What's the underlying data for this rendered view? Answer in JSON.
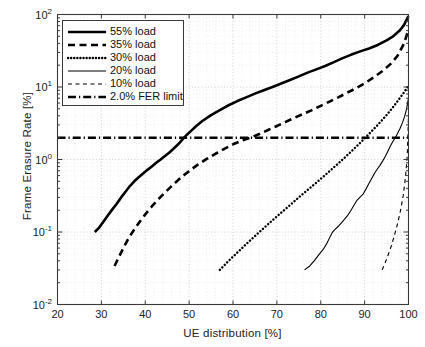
{
  "chart_data": {
    "type": "line",
    "title": "",
    "xlabel": "UE distribution [%]",
    "ylabel": "Frame Erasure Rate [%]",
    "xlim": [
      20,
      100
    ],
    "ylim": [
      0.01,
      100
    ],
    "yscale": "log",
    "xscale": "linear",
    "xticks": [
      "20",
      "30",
      "40",
      "50",
      "60",
      "70",
      "80",
      "90",
      "100"
    ],
    "xtick_values": [
      20,
      30,
      40,
      50,
      60,
      70,
      80,
      90,
      100
    ],
    "ytick_labels": [
      "10",
      "10",
      "10",
      "10",
      "10"
    ],
    "ytick_exponents": [
      "2",
      "1",
      "0",
      "-1",
      "-2"
    ],
    "ytick_values": [
      100,
      10,
      1,
      0.1,
      0.01
    ],
    "grid": true,
    "grid_minor": true,
    "legend_position": "upper left",
    "series": [
      {
        "name": "55% load",
        "style": "solid",
        "width": 2.6,
        "color": "#000000",
        "points": [
          [
            28.5,
            0.1
          ],
          [
            29.5,
            0.115
          ],
          [
            30.5,
            0.14
          ],
          [
            31.5,
            0.17
          ],
          [
            32.5,
            0.205
          ],
          [
            33.5,
            0.245
          ],
          [
            34.5,
            0.3
          ],
          [
            35.5,
            0.36
          ],
          [
            36.5,
            0.43
          ],
          [
            37.5,
            0.5
          ],
          [
            38.5,
            0.57
          ],
          [
            39.5,
            0.64
          ],
          [
            40.5,
            0.72
          ],
          [
            41.5,
            0.8
          ],
          [
            42.5,
            0.9
          ],
          [
            43.5,
            1.0
          ],
          [
            44.5,
            1.12
          ],
          [
            45.5,
            1.25
          ],
          [
            46.5,
            1.42
          ],
          [
            47.5,
            1.62
          ],
          [
            48.5,
            1.9
          ],
          [
            49.5,
            2.2
          ],
          [
            50.5,
            2.5
          ],
          [
            51.5,
            2.85
          ],
          [
            53.0,
            3.4
          ],
          [
            55.0,
            4.1
          ],
          [
            57.0,
            4.8
          ],
          [
            59.0,
            5.6
          ],
          [
            61.0,
            6.4
          ],
          [
            63.0,
            7.2
          ],
          [
            65.0,
            8.1
          ],
          [
            67.0,
            9.0
          ],
          [
            69.0,
            10.0
          ],
          [
            71.0,
            11.2
          ],
          [
            73.0,
            12.5
          ],
          [
            75.0,
            14.0
          ],
          [
            77.0,
            15.8
          ],
          [
            79.0,
            17.5
          ],
          [
            81.0,
            19.5
          ],
          [
            83.0,
            22.0
          ],
          [
            85.0,
            25.0
          ],
          [
            87.0,
            28.0
          ],
          [
            89.0,
            31.0
          ],
          [
            91.0,
            34.0
          ],
          [
            93.0,
            38.0
          ],
          [
            95.0,
            44.0
          ],
          [
            96.5,
            50.0
          ],
          [
            98.0,
            60.0
          ],
          [
            99.0,
            72.0
          ],
          [
            99.7,
            88.0
          ],
          [
            100.0,
            95.0
          ]
        ]
      },
      {
        "name": "35% load",
        "style": "dashed",
        "width": 2.6,
        "color": "#000000",
        "points": [
          [
            33.0,
            0.034
          ],
          [
            34.0,
            0.045
          ],
          [
            35.0,
            0.06
          ],
          [
            36.0,
            0.078
          ],
          [
            37.0,
            0.098
          ],
          [
            38.0,
            0.12
          ],
          [
            39.0,
            0.145
          ],
          [
            40.0,
            0.175
          ],
          [
            41.5,
            0.225
          ],
          [
            43.0,
            0.285
          ],
          [
            44.5,
            0.35
          ],
          [
            46.0,
            0.43
          ],
          [
            47.5,
            0.52
          ],
          [
            49.0,
            0.62
          ],
          [
            50.5,
            0.73
          ],
          [
            52.0,
            0.85
          ],
          [
            54.0,
            1.02
          ],
          [
            56.0,
            1.2
          ],
          [
            58.0,
            1.4
          ],
          [
            60.0,
            1.62
          ],
          [
            62.0,
            1.82
          ],
          [
            64.0,
            2.0
          ],
          [
            66.0,
            2.25
          ],
          [
            68.0,
            2.55
          ],
          [
            70.0,
            2.9
          ],
          [
            72.0,
            3.3
          ],
          [
            74.0,
            3.75
          ],
          [
            76.0,
            4.25
          ],
          [
            78.0,
            4.8
          ],
          [
            80.0,
            5.5
          ],
          [
            82.0,
            6.3
          ],
          [
            84.0,
            7.2
          ],
          [
            86.0,
            8.3
          ],
          [
            88.0,
            9.6
          ],
          [
            90.0,
            11.2
          ],
          [
            92.0,
            13.5
          ],
          [
            94.0,
            16.5
          ],
          [
            96.0,
            21.0
          ],
          [
            97.5,
            27.0
          ],
          [
            99.0,
            40.0
          ],
          [
            100.0,
            62.0
          ]
        ]
      },
      {
        "name": "30% load",
        "style": "dotted",
        "width": 2.4,
        "color": "#000000",
        "points": [
          [
            57.0,
            0.03
          ],
          [
            59.0,
            0.04
          ],
          [
            61.0,
            0.052
          ],
          [
            63.0,
            0.068
          ],
          [
            65.0,
            0.088
          ],
          [
            67.0,
            0.113
          ],
          [
            69.0,
            0.145
          ],
          [
            71.0,
            0.185
          ],
          [
            73.0,
            0.235
          ],
          [
            75.0,
            0.3
          ],
          [
            77.0,
            0.38
          ],
          [
            79.0,
            0.48
          ],
          [
            81.0,
            0.61
          ],
          [
            83.0,
            0.78
          ],
          [
            85.0,
            1.0
          ],
          [
            87.0,
            1.3
          ],
          [
            89.0,
            1.7
          ],
          [
            91.0,
            2.25
          ],
          [
            93.0,
            3.0
          ],
          [
            95.0,
            4.1
          ],
          [
            96.5,
            5.3
          ],
          [
            98.0,
            7.0
          ],
          [
            99.2,
            8.8
          ],
          [
            100.0,
            10.5
          ]
        ]
      },
      {
        "name": "20% load",
        "style": "solid",
        "width": 1.1,
        "color": "#000000",
        "points": [
          [
            76.3,
            0.03
          ],
          [
            77.5,
            0.034
          ],
          [
            78.5,
            0.04
          ],
          [
            79.5,
            0.048
          ],
          [
            80.5,
            0.057
          ],
          [
            81.3,
            0.068
          ],
          [
            82.0,
            0.083
          ],
          [
            82.6,
            0.098
          ],
          [
            83.2,
            0.108
          ],
          [
            84.0,
            0.12
          ],
          [
            85.0,
            0.14
          ],
          [
            86.0,
            0.165
          ],
          [
            86.8,
            0.195
          ],
          [
            87.5,
            0.23
          ],
          [
            88.2,
            0.27
          ],
          [
            88.9,
            0.3
          ],
          [
            89.6,
            0.33
          ],
          [
            90.3,
            0.39
          ],
          [
            91.0,
            0.47
          ],
          [
            91.7,
            0.56
          ],
          [
            92.3,
            0.65
          ],
          [
            92.9,
            0.74
          ],
          [
            93.5,
            0.83
          ],
          [
            94.1,
            0.95
          ],
          [
            94.7,
            1.1
          ],
          [
            95.3,
            1.3
          ],
          [
            95.9,
            1.55
          ],
          [
            96.5,
            1.8
          ],
          [
            97.1,
            2.05
          ],
          [
            97.6,
            2.35
          ],
          [
            98.1,
            2.7
          ],
          [
            98.6,
            3.2
          ],
          [
            99.1,
            3.9
          ],
          [
            99.5,
            4.8
          ],
          [
            99.8,
            6.0
          ],
          [
            100.0,
            7.0
          ]
        ]
      },
      {
        "name": "10% load",
        "style": "dashed",
        "width": 1.1,
        "color": "#000000",
        "points": [
          [
            94.0,
            0.03
          ],
          [
            95.0,
            0.042
          ],
          [
            96.0,
            0.062
          ],
          [
            96.8,
            0.09
          ],
          [
            97.5,
            0.13
          ],
          [
            98.2,
            0.2
          ],
          [
            98.8,
            0.32
          ],
          [
            99.3,
            0.56
          ],
          [
            99.7,
            1.1
          ],
          [
            99.9,
            2.4
          ],
          [
            100.0,
            4.2
          ]
        ]
      },
      {
        "name": "2.0% FER limit",
        "style": "dashdot",
        "width": 2.4,
        "color": "#000000",
        "constant_y": 2.0,
        "points": [
          [
            20,
            2.0
          ],
          [
            100,
            2.0
          ]
        ]
      }
    ],
    "annotations": []
  },
  "legend": {
    "entries": [
      {
        "label": "55% load"
      },
      {
        "label": "35% load"
      },
      {
        "label": "30% load"
      },
      {
        "label": "20% load"
      },
      {
        "label": "10% load"
      },
      {
        "label": "2.0% FER limit"
      }
    ]
  },
  "axes": {
    "x_label": "UE distribution [%]",
    "y_label": "Frame Erasure Rate [%]"
  },
  "colors": {
    "line": "#000000",
    "grid": "#b9b9b9",
    "axis": "#3a3a3a",
    "background": "#ffffff"
  }
}
